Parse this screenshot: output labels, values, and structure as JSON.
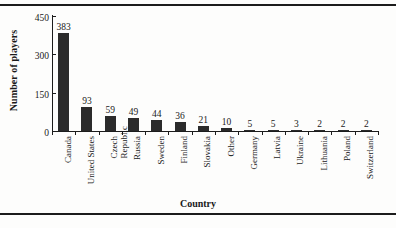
{
  "chart_data": {
    "type": "bar",
    "title": "",
    "subtitle": "",
    "xlabel": "Country",
    "ylabel": "Number of players",
    "categories": [
      "Canada",
      "United States",
      "Czech Republic",
      "Russia",
      "Sweden",
      "Finland",
      "Slovakia",
      "Other",
      "Germany",
      "Latvia",
      "Ukraine",
      "Lithuania",
      "Poland",
      "Switzerland"
    ],
    "category_lines": [
      [
        "Canada"
      ],
      [
        "United States"
      ],
      [
        "Czech",
        "Republic"
      ],
      [
        "Russia"
      ],
      [
        "Sweden"
      ],
      [
        "Finland"
      ],
      [
        "Slovakia"
      ],
      [
        "Other"
      ],
      [
        "Germany"
      ],
      [
        "Latvia"
      ],
      [
        "Ukraine"
      ],
      [
        "Lithuania"
      ],
      [
        "Poland"
      ],
      [
        "Switzerland"
      ]
    ],
    "values": [
      383,
      93,
      59,
      49,
      44,
      36,
      21,
      10,
      5,
      5,
      3,
      2,
      2,
      2
    ],
    "value_labels": [
      "383",
      "93",
      "59",
      "49",
      "44",
      "36",
      "21",
      "10",
      "5",
      "5",
      "3",
      "2",
      "2",
      "2"
    ],
    "ylim": [
      0,
      450
    ],
    "yticks": [
      0,
      150,
      300,
      450
    ],
    "ytick_labels": [
      "0",
      "150",
      "300",
      "450"
    ],
    "grid": false,
    "legend": false,
    "legend_position": "none",
    "bar_color": "#2b2b2b",
    "axis_color": "#1c1c1c",
    "background_color": "#fdfdfc"
  },
  "page": {
    "bottom_caption": ""
  }
}
